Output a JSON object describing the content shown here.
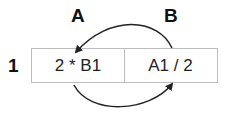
{
  "diagram": {
    "columns": [
      {
        "label": "A"
      },
      {
        "label": "B"
      }
    ],
    "rows": [
      {
        "label": "1"
      }
    ],
    "cells": [
      {
        "ref": "A1",
        "formula": "2 * B1"
      },
      {
        "ref": "B1",
        "formula": "A1 / 2"
      }
    ],
    "arrows": [
      {
        "from": "B1",
        "to": "A1",
        "position": "top"
      },
      {
        "from": "A1",
        "to": "B1",
        "position": "bottom"
      }
    ]
  }
}
